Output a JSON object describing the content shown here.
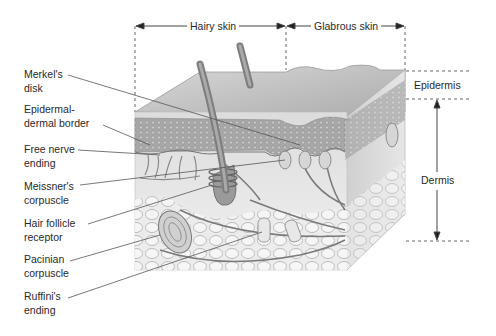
{
  "figure": {
    "top_regions": [
      {
        "label": "Hairy skin"
      },
      {
        "label": "Glabrous skin"
      }
    ],
    "layers": [
      {
        "label": "Epidermis"
      },
      {
        "label": "Dermis"
      }
    ],
    "callouts": [
      {
        "label": "Merkel's\ndisk"
      },
      {
        "label": "Epidermal-\ndermal border"
      },
      {
        "label": "Free nerve\nending"
      },
      {
        "label": "Meissner's\ncorpuscle"
      },
      {
        "label": "Hair follicle\nreceptor"
      },
      {
        "label": "Pacinian\ncorpuscle"
      },
      {
        "label": "Ruffini's\nending"
      }
    ],
    "colors": {
      "background": "#ffffff",
      "text": "#2a2a2a",
      "line": "#555555",
      "tissue_light": "#e4e4e4",
      "tissue_mid": "#bdbdbd",
      "tissue_dark": "#8a8a8a"
    }
  }
}
